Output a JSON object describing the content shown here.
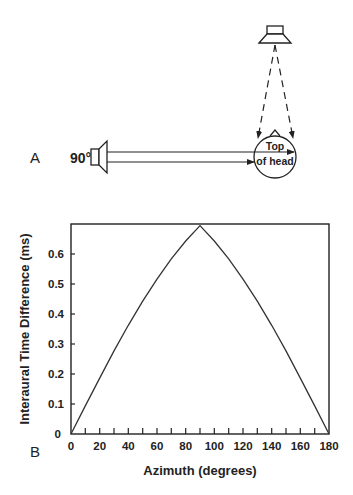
{
  "panel_a": {
    "label": "A",
    "side_speaker_angle": "90°",
    "head_label_line1": "Top",
    "head_label_line2": "of head"
  },
  "panel_b": {
    "label": "B"
  },
  "chart_data": {
    "type": "line",
    "title": "",
    "xlabel": "Azimuth (degrees)",
    "ylabel": "Interaural Time Difference (ms)",
    "xlim": [
      0,
      180
    ],
    "ylim": [
      0,
      0.69
    ],
    "x_ticks": [
      "0",
      "20",
      "40",
      "60",
      "80",
      "100",
      "120",
      "140",
      "160",
      "180"
    ],
    "y_ticks": [
      "0",
      "0.1",
      "0.2",
      "0.3",
      "0.4",
      "0.5",
      "0.6"
    ],
    "grid": false,
    "legend": null,
    "series": [
      {
        "name": "ITD",
        "x": [
          0,
          10,
          20,
          30,
          40,
          50,
          60,
          70,
          80,
          90,
          100,
          110,
          120,
          130,
          140,
          150,
          160,
          170,
          180
        ],
        "values": [
          0,
          0.093,
          0.185,
          0.275,
          0.36,
          0.44,
          0.513,
          0.58,
          0.639,
          0.69,
          0.639,
          0.58,
          0.513,
          0.44,
          0.36,
          0.275,
          0.185,
          0.093,
          0
        ]
      }
    ]
  }
}
